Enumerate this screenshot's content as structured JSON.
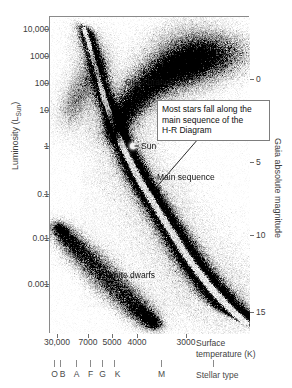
{
  "chart_data": {
    "type": "scatter",
    "title": "",
    "xlabel": "Surface temperature (K)",
    "ylabel": "Luminosity (L_Sun)",
    "ylabel_right": "Gaia absolute magnitude",
    "xlabel_line1": "Surface",
    "xlabel_line2": "temperature (K)",
    "x_scale": "log-reversed",
    "y_scale": "log",
    "xlim": [
      32000,
      2600
    ],
    "ylim": [
      0.0002,
      40000
    ],
    "x_ticks": [
      {
        "label": "30,000",
        "value": 30000
      },
      {
        "label": "7000",
        "value": 7000
      },
      {
        "label": "5000",
        "value": 5000
      },
      {
        "label": "4000",
        "value": 4000
      },
      {
        "label": "3000",
        "value": 3000
      }
    ],
    "y_ticks_left": [
      {
        "label": "10,000",
        "value": 10000
      },
      {
        "label": "1000",
        "value": 1000
      },
      {
        "label": "100",
        "value": 100
      },
      {
        "label": "10",
        "value": 10
      },
      {
        "label": "1",
        "value": 1
      },
      {
        "label": "0.1",
        "value": 0.1
      },
      {
        "label": "0.01",
        "value": 0.01
      },
      {
        "label": "0.001",
        "value": 0.001
      }
    ],
    "y_ticks_right": [
      {
        "label": "0",
        "value": 0
      },
      {
        "label": "5",
        "value": 5
      },
      {
        "label": "10",
        "value": 10
      },
      {
        "label": "15",
        "value": 15
      }
    ],
    "spectral_types": [
      {
        "label": "O",
        "tick_x": 54
      },
      {
        "label": "B",
        "tick_x": 60
      },
      {
        "label": "A",
        "tick_x": 76
      },
      {
        "label": "F",
        "tick_x": 90
      },
      {
        "label": "G",
        "tick_x": 102
      },
      {
        "label": "K",
        "tick_x": 114
      },
      {
        "label": "M",
        "tick_x": 161
      }
    ],
    "spectral_axis_title": "Stellar type",
    "grid": false,
    "legend": "none",
    "annotations": [
      {
        "name": "giant-branch",
        "text": "Giant branch"
      },
      {
        "name": "sun",
        "text": "Sun"
      },
      {
        "name": "main-sequence",
        "text": "Main sequence"
      },
      {
        "name": "white-dwarfs",
        "text": "White dwarfs"
      }
    ],
    "callout": {
      "line1": "Most stars fall along the",
      "line2": "main sequence of the",
      "line3": "H-R Diagram"
    },
    "populations": [
      {
        "name": "main sequence",
        "description": "dense diagonal band from hot/luminous upper-left to cool/faint lower-right"
      },
      {
        "name": "giant branch",
        "description": "broad plume of cool luminous stars upper-right, L from 10 to 10,000"
      },
      {
        "name": "white dwarfs",
        "description": "sparse faint band lower-left, L from 0.0003 to 0.03"
      },
      {
        "name": "Sun",
        "description": "marker at L = 1, T = 5772 K"
      }
    ]
  },
  "axis_titles": {
    "left": "Luminosity (L",
    "left_sub": "Sun",
    "left_close": ")",
    "right": "Gaia absolute magnitude"
  }
}
